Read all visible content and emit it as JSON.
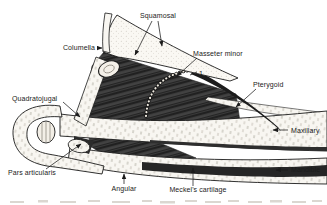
{
  "figure": {
    "colors": {
      "background": "#ffffff",
      "ink": "#1b1b1b",
      "muscle": "#3a3a3a",
      "bone": "#f8f6f1"
    },
    "labels": {
      "squamosal": "Squamosal",
      "columella": "Columella",
      "masseter_minor": "Masseter minor",
      "ref_1": "1",
      "pterygoid": "Pterygoid",
      "quadratojugal": "Quadratojugal",
      "maxillary": "Maxillary",
      "mandible": "Mandible",
      "pars_articularis": "Pars articularis",
      "angular": "Angular",
      "meckels_cartilage": "Meckel's cartilage"
    },
    "icons": {
      "maxillary_pointer": "left-arrow",
      "mandible_pointer": "left-arrow",
      "leader_arrowheads": "arrowhead"
    }
  }
}
